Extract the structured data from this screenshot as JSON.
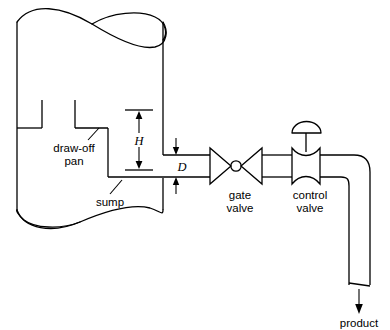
{
  "diagram": {
    "background_color": "#ffffff",
    "line_color": "#000000",
    "labels": {
      "draw_off_pan_line1": "draw-off",
      "draw_off_pan_line2": "pan",
      "sump": "sump",
      "gate_valve_line1": "gate",
      "gate_valve_line2": "valve",
      "control_valve_line1": "control",
      "control_valve_line2": "valve",
      "product": "product",
      "height_dimension": "H",
      "diameter_dimension": "D"
    },
    "components": [
      {
        "name": "vessel",
        "label": ""
      },
      {
        "name": "draw-off-pan",
        "label": "draw-off pan"
      },
      {
        "name": "sump",
        "label": "sump"
      },
      {
        "name": "gate-valve",
        "label": "gate valve"
      },
      {
        "name": "control-valve",
        "label": "control valve"
      },
      {
        "name": "product-outlet",
        "label": "product"
      }
    ],
    "dimensions": [
      {
        "name": "H",
        "symbol": "H",
        "description": "liquid head height from pan floor to pipe centerline"
      },
      {
        "name": "D",
        "symbol": "D",
        "description": "draw-off pipe diameter"
      }
    ]
  }
}
